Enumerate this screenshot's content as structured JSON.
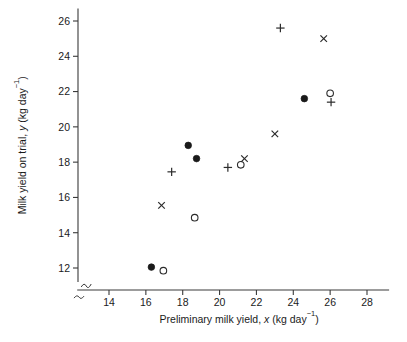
{
  "chart_data": {
    "type": "scatter",
    "title": "",
    "xlabel": "Preliminary milk yield, x (kg day⁻¹)",
    "ylabel": "Milk yield on trial, y (kg day⁻¹)",
    "xlabel_parts": {
      "before_italic": "Preliminary milk yield, ",
      "italic": "x",
      "after_italic": " (kg day",
      "superscript": "−1",
      "tail": ")"
    },
    "ylabel_parts": {
      "before_italic": "Milk yield on trial, ",
      "italic": "y",
      "after_italic": " (kg day",
      "superscript": "−1",
      "tail": ")"
    },
    "xlim": [
      12.6,
      29.2
    ],
    "ylim": [
      11.2,
      26.6
    ],
    "xticks": [
      14,
      16,
      18,
      20,
      22,
      24,
      26,
      28
    ],
    "yticks": [
      12,
      14,
      16,
      18,
      20,
      22,
      24,
      26
    ],
    "xtick_labels": [
      "14",
      "16",
      "18",
      "20",
      "22",
      "24",
      "26",
      "28"
    ],
    "ytick_labels": [
      "12",
      "14",
      "16",
      "18",
      "20",
      "22",
      "24",
      "26"
    ],
    "grid": false,
    "legend": "none",
    "axis_break": true,
    "marker_color": "#1a1a1a",
    "series": [
      {
        "name": "filled-circle",
        "marker": "filled-circle",
        "points": [
          {
            "x": 16.3,
            "y": 12.05
          },
          {
            "x": 18.3,
            "y": 18.95
          },
          {
            "x": 18.75,
            "y": 18.2
          },
          {
            "x": 24.6,
            "y": 21.6
          }
        ]
      },
      {
        "name": "open-circle",
        "marker": "open-circle",
        "points": [
          {
            "x": 16.95,
            "y": 11.85
          },
          {
            "x": 18.65,
            "y": 14.85
          },
          {
            "x": 21.15,
            "y": 17.85
          },
          {
            "x": 26.0,
            "y": 21.9
          }
        ]
      },
      {
        "name": "plus",
        "marker": "plus",
        "points": [
          {
            "x": 17.4,
            "y": 17.45
          },
          {
            "x": 20.45,
            "y": 17.7
          },
          {
            "x": 23.3,
            "y": 25.6
          },
          {
            "x": 26.05,
            "y": 21.4
          }
        ]
      },
      {
        "name": "cross",
        "marker": "cross",
        "points": [
          {
            "x": 16.85,
            "y": 15.55
          },
          {
            "x": 21.35,
            "y": 18.2
          },
          {
            "x": 23.0,
            "y": 19.6
          },
          {
            "x": 25.65,
            "y": 25.0
          }
        ]
      }
    ]
  }
}
